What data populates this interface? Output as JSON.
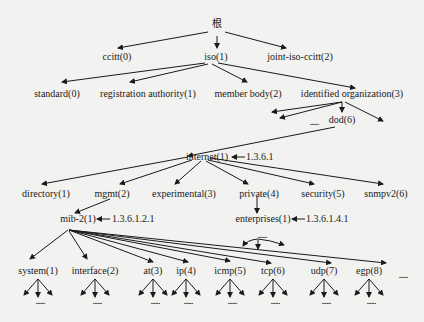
{
  "diagram": {
    "root": {
      "label": "根"
    },
    "level1": [
      {
        "label": "ccitt(0)"
      },
      {
        "label": "iso(1)"
      },
      {
        "label": "joint-iso-ccitt(2)"
      }
    ],
    "iso_children": [
      {
        "label": "standard(0)"
      },
      {
        "label": "registration authority(1)"
      },
      {
        "label": "member body(2)"
      },
      {
        "label": "identified organization(3)"
      }
    ],
    "dod": {
      "label": "dod(6)",
      "ellipsis": "......"
    },
    "internet": {
      "label": "internet(1)",
      "oid": "1.3.6.1"
    },
    "internet_children": [
      {
        "label": "directory(1)"
      },
      {
        "label": "mgmt(2)"
      },
      {
        "label": "experimental(3)"
      },
      {
        "label": "private(4)"
      },
      {
        "label": "security(5)"
      },
      {
        "label": "snmpv2(6)"
      }
    ],
    "mib2": {
      "label": "mib-2(1)",
      "oid": "1.3.6.1.2.1"
    },
    "enterprises": {
      "label": "enterprises(1)",
      "oid": "1.3.6.1.4.1",
      "ellipsis": "......"
    },
    "mib2_children": [
      {
        "label": "system(1)"
      },
      {
        "label": "interface(2)"
      },
      {
        "label": "at(3)"
      },
      {
        "label": "ip(4)"
      },
      {
        "label": "icmp(5)"
      },
      {
        "label": "tcp(6)"
      },
      {
        "label": "udp(7)"
      },
      {
        "label": "egp(8)"
      }
    ],
    "trailing_ellipsis": "......",
    "leaf_ellipsis": "......"
  }
}
